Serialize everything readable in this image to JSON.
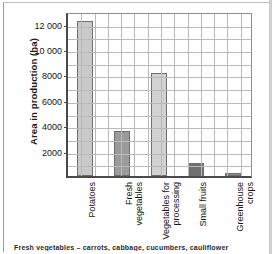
{
  "chart_data": {
    "type": "bar",
    "title": "",
    "xlabel": "",
    "ylabel": "Area in production (ha)",
    "categories": [
      "Potatoes",
      "Fresh vegetables",
      "Vegetables for processing",
      "Small fruits",
      "Greenhouse crops"
    ],
    "category_lines": [
      [
        "Potatoes"
      ],
      [
        "Fresh",
        "vegetables"
      ],
      [
        "Vegetables for",
        "processing"
      ],
      [
        "Small fruits"
      ],
      [
        "Greenhouse",
        "crops"
      ]
    ],
    "values": [
      12200,
      3550,
      8150,
      1000,
      150
    ],
    "bar_colors": [
      "#c9c9c9",
      "#9b9b9b",
      "#d2d2d2",
      "#6f6f6f",
      "#8e8e8e"
    ],
    "ylim": [
      0,
      13000
    ],
    "yticks": [
      2000,
      4000,
      6000,
      8000,
      10000,
      12000
    ],
    "ytick_labels": [
      "2000",
      "4000",
      "6000",
      "8000",
      "10 000",
      "12 000"
    ],
    "grid": true,
    "grid_color": "#b9b9b9",
    "legend": "none",
    "axis_color": "#4a4a4a"
  },
  "caption": {
    "text": "Fresh vegetables – carrots, cabbage, cucumbers, cauliflower"
  }
}
